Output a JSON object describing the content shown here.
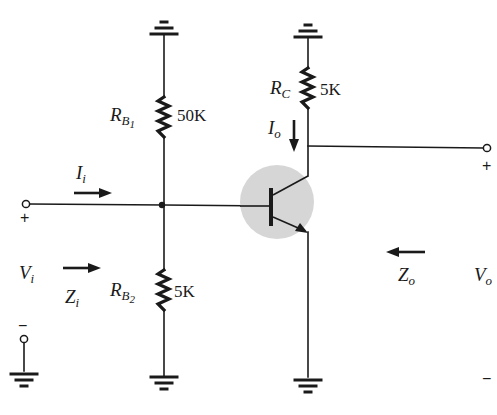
{
  "diagram": {
    "type": "voltage-divider-bias BJT amplifier (common-emitter, emitter grounded)",
    "colors": {
      "wire": "#1a1a1a",
      "transistor_highlight": "#d6d6d6",
      "background": "#ffffff"
    },
    "components": {
      "rb1": {
        "name": "R",
        "sub": "B",
        "subsub": "1",
        "value": "50K"
      },
      "rb2": {
        "name": "R",
        "sub": "B",
        "subsub": "2",
        "value": "5K"
      },
      "rc": {
        "name": "R",
        "sub": "C",
        "value": "5K"
      },
      "transistor": {
        "type": "NPN"
      }
    },
    "labels": {
      "ii": {
        "name": "I",
        "sub": "i"
      },
      "io": {
        "name": "I",
        "sub": "o"
      },
      "vi": {
        "name": "V",
        "sub": "i"
      },
      "zi": {
        "name": "Z",
        "sub": "i"
      },
      "zo": {
        "name": "Z",
        "sub": "o"
      },
      "vo": {
        "name": "V",
        "sub": "o"
      }
    },
    "terminals": {
      "input_plus": "+",
      "input_minus": "−",
      "output_plus": "+",
      "output_minus": "−"
    }
  }
}
